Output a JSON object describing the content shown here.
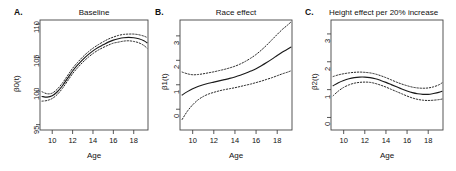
{
  "figure": {
    "background": "#ffffff",
    "line_color": "#1a1a1a",
    "panels": [
      {
        "letter": "A.",
        "title": "Baseline",
        "xlabel": "Age",
        "ylabel": "β0(t)",
        "xticks": [
          "10",
          "12",
          "14",
          "16",
          "18"
        ],
        "yticks": [
          "95",
          "100",
          "105",
          "110"
        ]
      },
      {
        "letter": "B.",
        "title": "Race effect",
        "xlabel": "Age",
        "ylabel": "β1(t)",
        "xticks": [
          "10",
          "12",
          "14",
          "16",
          "18"
        ],
        "yticks": [
          "0",
          "1",
          "2",
          "3"
        ]
      },
      {
        "letter": "C.",
        "title": "Height effect per 20% increase",
        "xlabel": "Age",
        "ylabel": "β2(t)",
        "xticks": [
          "10",
          "12",
          "14",
          "16",
          "18"
        ],
        "yticks": [
          "0",
          "1",
          "2",
          "3"
        ]
      }
    ]
  },
  "chart_data": [
    {
      "type": "line",
      "title": "Baseline",
      "panel": "A.",
      "xlabel": "Age",
      "ylabel": "β0(t)",
      "xlim": [
        8.8,
        19.4
      ],
      "ylim": [
        94.2,
        110.6
      ],
      "xticks": [
        10,
        12,
        14,
        16,
        18
      ],
      "yticks": [
        95,
        100,
        105,
        110
      ],
      "grid": false,
      "legend": null,
      "x": [
        9.0,
        9.5,
        10.0,
        10.5,
        11.0,
        11.5,
        12.0,
        12.5,
        13.0,
        13.5,
        14.0,
        14.5,
        15.0,
        15.5,
        16.0,
        16.5,
        17.0,
        17.5,
        18.0,
        18.5,
        19.0,
        19.3
      ],
      "series": [
        {
          "name": "estimate",
          "style": "solid",
          "values": [
            99.2,
            99.1,
            99.3,
            99.9,
            100.8,
            101.9,
            103.0,
            103.9,
            104.7,
            105.4,
            106.0,
            106.5,
            106.9,
            107.3,
            107.6,
            107.8,
            107.95,
            108.0,
            107.95,
            107.8,
            107.5,
            107.2
          ]
        },
        {
          "name": "upper-95-ci",
          "style": "dotted",
          "values": [
            99.9,
            99.6,
            99.7,
            100.3,
            101.2,
            102.3,
            103.4,
            104.3,
            105.1,
            105.8,
            106.4,
            106.9,
            107.35,
            107.75,
            108.05,
            108.3,
            108.45,
            108.5,
            108.5,
            108.4,
            108.2,
            108.0
          ]
        },
        {
          "name": "lower-95-ci",
          "style": "dotted",
          "values": [
            98.5,
            98.6,
            98.9,
            99.5,
            100.4,
            101.5,
            102.6,
            103.5,
            104.3,
            105.0,
            105.6,
            106.1,
            106.5,
            106.85,
            107.15,
            107.3,
            107.45,
            107.5,
            107.4,
            107.2,
            106.8,
            106.4
          ]
        }
      ]
    },
    {
      "type": "line",
      "title": "Race effect",
      "panel": "B.",
      "xlabel": "Age",
      "ylabel": "β1(t)",
      "xlim": [
        8.8,
        19.4
      ],
      "ylim": [
        -0.85,
        3.65
      ],
      "xticks": [
        10,
        12,
        14,
        16,
        18
      ],
      "yticks": [
        0,
        1,
        2,
        3
      ],
      "grid": false,
      "legend": null,
      "x": [
        9.0,
        9.5,
        10.0,
        10.5,
        11.0,
        11.5,
        12.0,
        12.5,
        13.0,
        13.5,
        14.0,
        14.5,
        15.0,
        15.5,
        16.0,
        16.5,
        17.0,
        17.5,
        18.0,
        18.5,
        19.0,
        19.3
      ],
      "series": [
        {
          "name": "estimate",
          "style": "solid",
          "values": [
            0.58,
            0.72,
            0.84,
            0.93,
            1.0,
            1.06,
            1.11,
            1.16,
            1.21,
            1.26,
            1.32,
            1.39,
            1.47,
            1.56,
            1.66,
            1.78,
            1.91,
            2.05,
            2.2,
            2.34,
            2.46,
            2.54
          ]
        },
        {
          "name": "upper-95-ci",
          "style": "dotted",
          "values": [
            1.52,
            1.45,
            1.41,
            1.42,
            1.45,
            1.49,
            1.53,
            1.58,
            1.63,
            1.69,
            1.76,
            1.85,
            1.96,
            2.09,
            2.24,
            2.42,
            2.62,
            2.84,
            3.06,
            3.27,
            3.45,
            3.57
          ]
        },
        {
          "name": "lower-95-ci",
          "style": "dotted",
          "values": [
            -0.42,
            -0.08,
            0.18,
            0.38,
            0.52,
            0.62,
            0.69,
            0.75,
            0.8,
            0.84,
            0.88,
            0.93,
            0.98,
            1.03,
            1.09,
            1.15,
            1.22,
            1.29,
            1.37,
            1.45,
            1.52,
            1.57
          ]
        }
      ]
    },
    {
      "type": "line",
      "title": "Height effect per 20% increase",
      "panel": "C.",
      "xlabel": "Age",
      "ylabel": "β2(t)",
      "xlim": [
        8.8,
        19.4
      ],
      "ylim": [
        -0.45,
        3.5
      ],
      "xticks": [
        10,
        12,
        14,
        16,
        18
      ],
      "yticks": [
        0,
        1,
        2,
        3
      ],
      "grid": false,
      "legend": null,
      "x": [
        9.0,
        9.5,
        10.0,
        10.5,
        11.0,
        11.5,
        12.0,
        12.5,
        13.0,
        13.5,
        14.0,
        14.5,
        15.0,
        15.5,
        16.0,
        16.5,
        17.0,
        17.5,
        18.0,
        18.5,
        19.0,
        19.3
      ],
      "series": [
        {
          "name": "estimate",
          "style": "solid",
          "values": [
            1.14,
            1.25,
            1.33,
            1.39,
            1.43,
            1.45,
            1.45,
            1.43,
            1.39,
            1.33,
            1.26,
            1.18,
            1.1,
            1.02,
            0.95,
            0.89,
            0.85,
            0.83,
            0.83,
            0.86,
            0.9,
            0.94
          ]
        },
        {
          "name": "upper-95-ci",
          "style": "dotted",
          "values": [
            1.47,
            1.53,
            1.57,
            1.6,
            1.62,
            1.63,
            1.62,
            1.6,
            1.56,
            1.5,
            1.43,
            1.35,
            1.27,
            1.2,
            1.14,
            1.09,
            1.06,
            1.05,
            1.06,
            1.1,
            1.17,
            1.24
          ]
        },
        {
          "name": "lower-95-ci",
          "style": "dotted",
          "values": [
            0.78,
            0.95,
            1.08,
            1.17,
            1.23,
            1.26,
            1.27,
            1.26,
            1.22,
            1.16,
            1.09,
            1.01,
            0.93,
            0.85,
            0.77,
            0.7,
            0.65,
            0.62,
            0.61,
            0.62,
            0.64,
            0.66
          ]
        }
      ]
    }
  ]
}
